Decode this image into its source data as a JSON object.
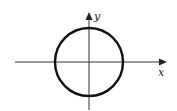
{
  "diagram": {
    "type": "coordinate-plane-circle",
    "x_axis_label": "x",
    "y_axis_label": "y",
    "circle": {
      "cx": 89,
      "cy": 62,
      "r": 34,
      "stroke": "#111111",
      "stroke_width": 2.4
    },
    "axes": {
      "color": "#333333",
      "x_axis": {
        "x1": 15,
        "x2": 166,
        "y": 62
      },
      "y_axis": {
        "x": 89,
        "y1": 110,
        "y2": 12
      }
    }
  }
}
